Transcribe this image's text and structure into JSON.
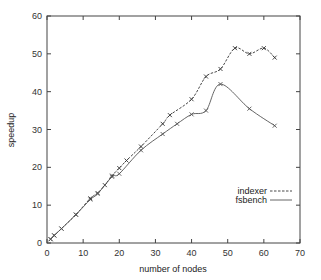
{
  "chart_data": {
    "type": "line",
    "title": "",
    "xlabel": "number of nodes",
    "ylabel": "speedup",
    "xlim": [
      0,
      70
    ],
    "ylim": [
      0,
      60
    ],
    "xticks": [
      0,
      10,
      20,
      30,
      40,
      50,
      60,
      70
    ],
    "yticks": [
      0,
      10,
      20,
      30,
      40,
      50,
      60
    ],
    "grid": false,
    "legend_position": "right-center",
    "series": [
      {
        "name": "indexer",
        "style": "dashed",
        "marker": "x",
        "color": "#333333",
        "x": [
          1,
          2,
          4,
          8,
          12,
          14,
          16,
          18,
          20,
          22,
          26,
          32,
          34,
          40,
          44,
          48,
          52,
          56,
          60,
          63
        ],
        "y": [
          1,
          2,
          3.8,
          7.5,
          11.8,
          13.2,
          15.3,
          17.8,
          19.8,
          21.8,
          25.5,
          31.5,
          33.8,
          38,
          44,
          46,
          51.5,
          50,
          51.5,
          49
        ]
      },
      {
        "name": "fsbench",
        "style": "solid",
        "marker": "x",
        "color": "#555555",
        "x": [
          1,
          2,
          4,
          8,
          12,
          14,
          18,
          20,
          26,
          32,
          36,
          40,
          44,
          48,
          56,
          63
        ],
        "y": [
          1,
          2,
          3.8,
          7.5,
          11.5,
          13,
          17.5,
          18.3,
          24.5,
          28.8,
          31.5,
          34,
          35,
          42,
          35.5,
          31
        ]
      }
    ]
  }
}
